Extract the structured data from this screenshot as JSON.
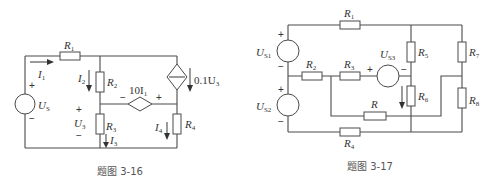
{
  "figures": [
    {
      "caption": "题图 3-16",
      "labels": {
        "R1": "R",
        "R1_sub": "1",
        "R2": "R",
        "R2_sub": "2",
        "R3": "R",
        "R3_sub": "3",
        "R4": "R",
        "R4_sub": "4",
        "I1": "I",
        "I1_sub": "1",
        "I2": "I",
        "I2_sub": "2",
        "I3": "I",
        "I3_sub": "3",
        "I4": "I",
        "I4_sub": "4",
        "US": "U",
        "US_sub": "S",
        "U3": "U",
        "U3_sub": "3",
        "ccvs": "10I",
        "ccvs_sub": "1",
        "vccs": "0.1U",
        "vccs_sub": "3",
        "plus": "+",
        "minus": "−"
      }
    },
    {
      "caption": "题图 3-17",
      "labels": {
        "R1": "R",
        "R1_sub": "1",
        "R2": "R",
        "R2_sub": "2",
        "R3": "R",
        "R3_sub": "3",
        "R4": "R",
        "R4_sub": "4",
        "R5": "R",
        "R5_sub": "5",
        "R6": "R",
        "R6_sub": "6",
        "R7": "R",
        "R7_sub": "7",
        "R8": "R",
        "R8_sub": "8",
        "R": "R",
        "US1": "U",
        "US1_sub": "S1",
        "US2": "U",
        "US2_sub": "S2",
        "US3": "U",
        "US3_sub": "S3",
        "plus": "+",
        "minus": "−"
      }
    }
  ]
}
